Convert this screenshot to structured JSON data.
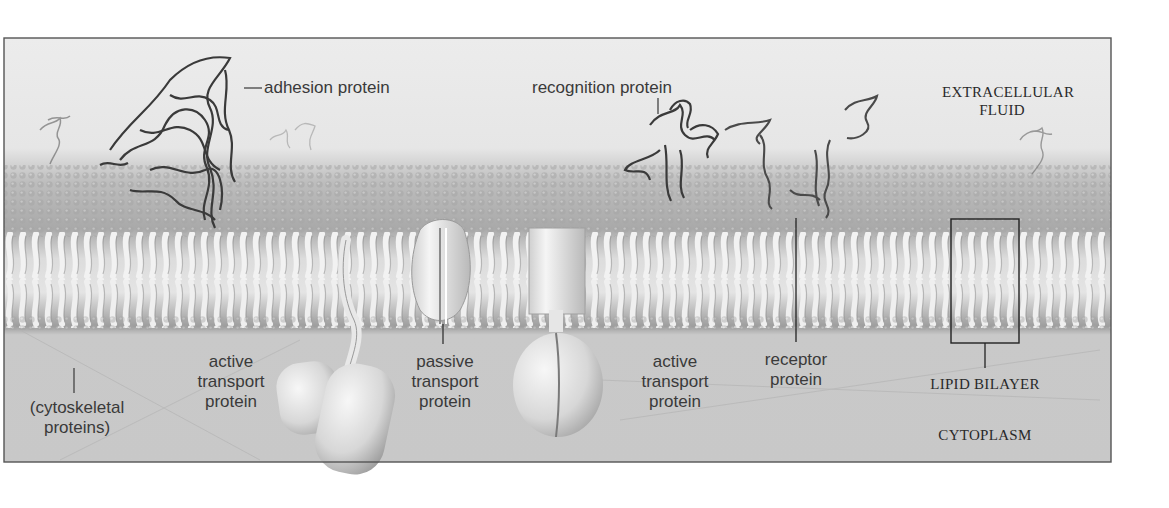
{
  "figure": {
    "regions": {
      "top": "EXTRACELLULAR FLUID",
      "top_line1": "EXTRACELLULAR",
      "top_line2": "FLUID",
      "bottom": "CYTOPLASM"
    },
    "labels": {
      "adhesion": "adhesion protein",
      "recognition": "recognition protein",
      "cyto_line1": "(cytoskeletal",
      "cyto_line2": "proteins)",
      "active1_line1": "active",
      "active1_line2": "transport",
      "active1_line3": "protein",
      "passive_line1": "passive",
      "passive_line2": "transport",
      "passive_line3": "protein",
      "active2_line1": "active",
      "active2_line2": "transport",
      "active2_line3": "protein",
      "receptor_line1": "receptor",
      "receptor_line2": "protein",
      "bilayer": "LIPID BILAYER"
    },
    "colors": {
      "frame": "#555555",
      "extracellular": "#ebebeb",
      "cytoplasm": "#c9c9c9",
      "lipid_head": "#9a9a9a",
      "lipid_tail": "#e8e8e8",
      "protein_ribbon": "#3c3c3c",
      "transport_protein": "#d8d8d8",
      "label_text": "#3a3a3a"
    }
  }
}
